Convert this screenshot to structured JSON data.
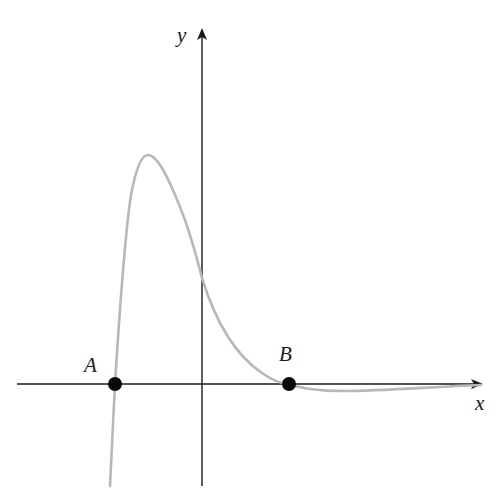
{
  "diagram": {
    "type": "function-graph",
    "axes": {
      "x_label": "x",
      "y_label": "y"
    },
    "points": [
      {
        "label": "A",
        "description": "x-intercept left of origin"
      },
      {
        "label": "B",
        "description": "x-intercept right of origin"
      }
    ],
    "curve": {
      "description": "Rises steeply from below through A, peaks left of y-axis, decreases through positive y-intercept to B, dips slightly below x-axis then approaches x-axis asymptotically",
      "color": "#b8b8b8"
    },
    "colors": {
      "axis": "#1a1a1a",
      "point": "#0a0a0a"
    }
  }
}
